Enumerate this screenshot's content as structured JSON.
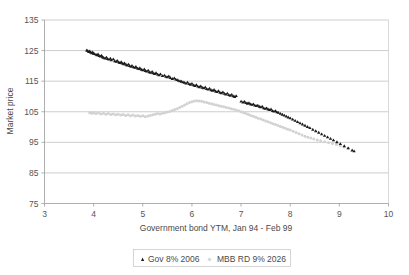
{
  "chart_data": {
    "type": "scatter",
    "title": "",
    "xlabel": "Government bond YTM, Jan 94 - Feb 99",
    "ylabel": "Market price",
    "xlim": [
      3,
      10
    ],
    "ylim": [
      75,
      135
    ],
    "xticks": [
      3,
      4,
      5,
      6,
      7,
      8,
      9,
      10
    ],
    "yticks": [
      75,
      85,
      95,
      105,
      115,
      125,
      135
    ],
    "grid": "horizontal",
    "legend_position": "bottom",
    "series": [
      {
        "name": "Gov 8% 2006",
        "color": "#1a1a1a",
        "marker": "triangle",
        "points": [
          [
            3.86,
            125.1
          ],
          [
            3.88,
            124.9
          ],
          [
            3.9,
            124.6
          ],
          [
            3.92,
            124.8
          ],
          [
            3.94,
            124.4
          ],
          [
            3.96,
            124.2
          ],
          [
            3.98,
            124.5
          ],
          [
            4.0,
            124.0
          ],
          [
            4.02,
            123.9
          ],
          [
            4.05,
            123.7
          ],
          [
            4.07,
            123.5
          ],
          [
            4.09,
            123.8
          ],
          [
            4.11,
            123.3
          ],
          [
            4.14,
            123.1
          ],
          [
            4.16,
            123.4
          ],
          [
            4.18,
            122.9
          ],
          [
            4.2,
            122.7
          ],
          [
            4.23,
            122.5
          ],
          [
            4.26,
            122.8
          ],
          [
            4.28,
            122.3
          ],
          [
            4.31,
            122.1
          ],
          [
            4.34,
            122.4
          ],
          [
            4.36,
            121.9
          ],
          [
            4.4,
            122.2
          ],
          [
            4.43,
            121.6
          ],
          [
            4.46,
            121.4
          ],
          [
            4.48,
            121.7
          ],
          [
            4.51,
            121.2
          ],
          [
            4.53,
            121.0
          ],
          [
            4.56,
            121.3
          ],
          [
            4.58,
            120.8
          ],
          [
            4.61,
            120.6
          ],
          [
            4.63,
            120.9
          ],
          [
            4.66,
            120.4
          ],
          [
            4.68,
            120.2
          ],
          [
            4.71,
            120.5
          ],
          [
            4.73,
            120.0
          ],
          [
            4.76,
            119.8
          ],
          [
            4.78,
            120.1
          ],
          [
            4.81,
            119.6
          ],
          [
            4.84,
            119.4
          ],
          [
            4.86,
            119.7
          ],
          [
            4.89,
            119.2
          ],
          [
            4.92,
            119.0
          ],
          [
            4.94,
            119.3
          ],
          [
            4.97,
            118.8
          ],
          [
            5.0,
            118.6
          ],
          [
            5.03,
            118.9
          ],
          [
            5.05,
            118.4
          ],
          [
            5.08,
            118.2
          ],
          [
            5.11,
            118.5
          ],
          [
            5.13,
            118.0
          ],
          [
            5.16,
            117.8
          ],
          [
            5.19,
            118.1
          ],
          [
            5.21,
            117.6
          ],
          [
            5.24,
            117.4
          ],
          [
            5.27,
            117.7
          ],
          [
            5.3,
            117.2
          ],
          [
            5.33,
            117.0
          ],
          [
            5.36,
            117.3
          ],
          [
            5.4,
            116.7
          ],
          [
            5.44,
            116.9
          ],
          [
            5.47,
            116.5
          ],
          [
            5.5,
            116.3
          ],
          [
            5.53,
            116.6
          ],
          [
            5.56,
            116.1
          ],
          [
            5.6,
            115.8
          ],
          [
            5.64,
            116.0
          ],
          [
            5.67,
            115.6
          ],
          [
            5.7,
            115.4
          ],
          [
            5.73,
            115.2
          ],
          [
            5.76,
            115.0
          ],
          [
            5.79,
            114.9
          ],
          [
            5.82,
            114.7
          ],
          [
            5.85,
            114.5
          ],
          [
            5.88,
            114.3
          ],
          [
            5.91,
            114.6
          ],
          [
            5.94,
            114.1
          ],
          [
            5.97,
            113.9
          ],
          [
            6.0,
            114.2
          ],
          [
            6.03,
            113.7
          ],
          [
            6.06,
            113.5
          ],
          [
            6.09,
            113.8
          ],
          [
            6.12,
            113.3
          ],
          [
            6.15,
            113.1
          ],
          [
            6.18,
            113.4
          ],
          [
            6.21,
            112.9
          ],
          [
            6.24,
            112.7
          ],
          [
            6.27,
            113.0
          ],
          [
            6.3,
            112.5
          ],
          [
            6.33,
            112.3
          ],
          [
            6.36,
            112.6
          ],
          [
            6.39,
            112.1
          ],
          [
            6.42,
            111.9
          ],
          [
            6.45,
            112.2
          ],
          [
            6.48,
            111.7
          ],
          [
            6.51,
            111.5
          ],
          [
            6.54,
            111.8
          ],
          [
            6.57,
            111.3
          ],
          [
            6.6,
            111.1
          ],
          [
            6.63,
            111.4
          ],
          [
            6.66,
            110.9
          ],
          [
            6.69,
            110.7
          ],
          [
            6.72,
            111.0
          ],
          [
            6.75,
            110.5
          ],
          [
            6.78,
            110.3
          ],
          [
            6.81,
            110.6
          ],
          [
            6.84,
            110.1
          ],
          [
            6.87,
            109.9
          ],
          [
            6.9,
            110.2
          ],
          [
            7.0,
            108.4
          ],
          [
            7.04,
            108.1
          ],
          [
            7.07,
            108.3
          ],
          [
            7.1,
            107.9
          ],
          [
            7.13,
            107.7
          ],
          [
            7.16,
            107.9
          ],
          [
            7.19,
            107.5
          ],
          [
            7.22,
            107.3
          ],
          [
            7.25,
            107.5
          ],
          [
            7.28,
            107.1
          ],
          [
            7.31,
            106.9
          ],
          [
            7.34,
            107.1
          ],
          [
            7.37,
            106.7
          ],
          [
            7.4,
            106.5
          ],
          [
            7.43,
            106.7
          ],
          [
            7.46,
            106.2
          ],
          [
            7.49,
            106.0
          ],
          [
            7.52,
            106.2
          ],
          [
            7.55,
            105.8
          ],
          [
            7.58,
            105.6
          ],
          [
            7.61,
            105.8
          ],
          [
            7.64,
            105.3
          ],
          [
            7.67,
            105.1
          ],
          [
            7.7,
            105.3
          ],
          [
            7.73,
            104.9
          ],
          [
            7.76,
            104.7
          ],
          [
            7.8,
            104.4
          ],
          [
            7.84,
            104.1
          ],
          [
            7.88,
            103.8
          ],
          [
            7.92,
            103.5
          ],
          [
            7.96,
            103.2
          ],
          [
            8.0,
            102.9
          ],
          [
            8.05,
            102.5
          ],
          [
            8.1,
            102.1
          ],
          [
            8.15,
            101.7
          ],
          [
            8.2,
            101.3
          ],
          [
            8.25,
            100.9
          ],
          [
            8.3,
            100.5
          ],
          [
            8.35,
            100.1
          ],
          [
            8.4,
            99.7
          ],
          [
            8.46,
            99.2
          ],
          [
            8.52,
            98.7
          ],
          [
            8.58,
            98.2
          ],
          [
            8.64,
            97.7
          ],
          [
            8.7,
            97.2
          ],
          [
            8.76,
            96.7
          ],
          [
            8.82,
            96.2
          ],
          [
            8.88,
            95.7
          ],
          [
            8.95,
            95.1
          ],
          [
            9.02,
            94.5
          ],
          [
            9.1,
            93.8
          ],
          [
            9.18,
            93.1
          ],
          [
            9.26,
            92.4
          ],
          [
            9.3,
            92.1
          ]
        ]
      },
      {
        "name": "MBB RD 9% 2026",
        "color": "#d2d2d2",
        "marker": "dot",
        "points": [
          [
            3.92,
            104.7
          ],
          [
            3.96,
            104.5
          ],
          [
            4.0,
            104.6
          ],
          [
            4.05,
            104.4
          ],
          [
            4.1,
            104.6
          ],
          [
            4.15,
            104.3
          ],
          [
            4.2,
            104.5
          ],
          [
            4.25,
            104.2
          ],
          [
            4.3,
            104.4
          ],
          [
            4.35,
            104.1
          ],
          [
            4.4,
            104.3
          ],
          [
            4.45,
            104.0
          ],
          [
            4.5,
            104.2
          ],
          [
            4.55,
            103.9
          ],
          [
            4.6,
            104.1
          ],
          [
            4.65,
            103.8
          ],
          [
            4.7,
            104.0
          ],
          [
            4.75,
            103.7
          ],
          [
            4.8,
            103.9
          ],
          [
            4.85,
            103.6
          ],
          [
            4.9,
            103.8
          ],
          [
            4.95,
            103.5
          ],
          [
            5.0,
            103.7
          ],
          [
            5.05,
            103.4
          ],
          [
            5.1,
            103.6
          ],
          [
            5.15,
            103.8
          ],
          [
            5.2,
            104.0
          ],
          [
            5.25,
            104.2
          ],
          [
            5.3,
            104.4
          ],
          [
            5.35,
            104.3
          ],
          [
            5.4,
            104.5
          ],
          [
            5.45,
            104.7
          ],
          [
            5.5,
            104.9
          ],
          [
            5.55,
            105.1
          ],
          [
            5.6,
            105.4
          ],
          [
            5.65,
            105.7
          ],
          [
            5.7,
            106.0
          ],
          [
            5.75,
            106.4
          ],
          [
            5.8,
            106.8
          ],
          [
            5.85,
            107.2
          ],
          [
            5.9,
            107.6
          ],
          [
            5.95,
            108.0
          ],
          [
            6.0,
            108.3
          ],
          [
            6.05,
            108.5
          ],
          [
            6.1,
            108.6
          ],
          [
            6.15,
            108.5
          ],
          [
            6.2,
            108.4
          ],
          [
            6.25,
            108.2
          ],
          [
            6.3,
            108.0
          ],
          [
            6.35,
            107.8
          ],
          [
            6.4,
            107.6
          ],
          [
            6.45,
            107.4
          ],
          [
            6.5,
            107.2
          ],
          [
            6.55,
            107.0
          ],
          [
            6.6,
            106.8
          ],
          [
            6.65,
            106.6
          ],
          [
            6.7,
            106.4
          ],
          [
            6.75,
            106.2
          ],
          [
            6.8,
            106.0
          ],
          [
            6.85,
            105.8
          ],
          [
            6.9,
            105.6
          ],
          [
            6.95,
            105.3
          ],
          [
            7.0,
            105.0
          ],
          [
            7.05,
            104.7
          ],
          [
            7.1,
            104.4
          ],
          [
            7.15,
            104.1
          ],
          [
            7.2,
            103.8
          ],
          [
            7.25,
            103.5
          ],
          [
            7.3,
            103.2
          ],
          [
            7.35,
            102.9
          ],
          [
            7.4,
            102.6
          ],
          [
            7.45,
            102.3
          ],
          [
            7.5,
            102.0
          ],
          [
            7.55,
            101.7
          ],
          [
            7.6,
            101.4
          ],
          [
            7.65,
            101.1
          ],
          [
            7.7,
            100.8
          ],
          [
            7.75,
            100.5
          ],
          [
            7.8,
            100.2
          ],
          [
            7.85,
            99.9
          ],
          [
            7.9,
            99.6
          ],
          [
            7.95,
            99.3
          ],
          [
            8.0,
            99.0
          ],
          [
            8.06,
            98.6
          ],
          [
            8.12,
            98.2
          ],
          [
            8.18,
            97.8
          ],
          [
            8.24,
            97.4
          ],
          [
            8.3,
            97.0
          ],
          [
            8.36,
            96.7
          ],
          [
            8.42,
            96.4
          ],
          [
            8.48,
            96.1
          ],
          [
            8.55,
            95.8
          ],
          [
            8.62,
            95.5
          ],
          [
            8.7,
            95.2
          ],
          [
            8.78,
            94.9
          ],
          [
            8.86,
            94.6
          ],
          [
            8.94,
            94.3
          ],
          [
            9.02,
            93.9
          ],
          [
            9.1,
            93.5
          ],
          [
            9.18,
            93.1
          ]
        ]
      }
    ]
  },
  "legend": {
    "items": [
      {
        "label": "Gov 8% 2006"
      },
      {
        "label": "MBB RD 9% 2026"
      }
    ]
  }
}
